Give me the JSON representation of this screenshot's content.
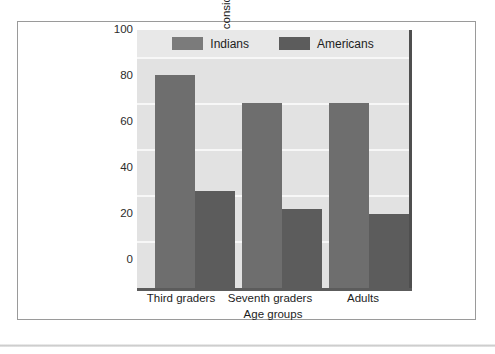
{
  "chart_data": {
    "type": "bar",
    "title": "",
    "subtitle": "",
    "xlabel": "Age groups",
    "ylabel": "Solutions based on interpersonal considerations (percent)",
    "ylabel_line1": "Solutions based on interpersonal considerations",
    "ylabel_line2": "(percent)",
    "categories": [
      "Third graders",
      "Seventh graders",
      "Adults"
    ],
    "series": [
      {
        "name": "Indians",
        "values": [
          92,
          80,
          80
        ],
        "color": "#6e6e6e"
      },
      {
        "name": "Americans",
        "values": [
          42,
          34,
          32
        ],
        "color": "#5c5c5c"
      }
    ],
    "ylim": [
      0,
      100
    ],
    "yticks": [
      0,
      20,
      40,
      60,
      80,
      100
    ],
    "ytick_labels": [
      "0",
      "20",
      "40",
      "60",
      "80",
      "100"
    ],
    "grid": "horizontal",
    "grid_color": "#f7f7f7",
    "plot_background": "#e2e2e2",
    "legend_position": "top-center"
  },
  "legend": {
    "items": [
      {
        "label": "Indians",
        "swatch": "legend-swatch-indians"
      },
      {
        "label": "Americans",
        "swatch": "legend-swatch-americans"
      }
    ]
  },
  "axes": {
    "y_title_line1": "Solutions based on interpersonal considerations",
    "y_title_line2": "(percent)",
    "x_title": "Age groups",
    "y_tick_0": "0",
    "y_tick_20": "20",
    "y_tick_40": "40",
    "y_tick_60": "60",
    "y_tick_80": "80",
    "y_tick_100": "100",
    "x_tick_0": "Third graders",
    "x_tick_1": "Seventh graders",
    "x_tick_2": "Adults"
  }
}
